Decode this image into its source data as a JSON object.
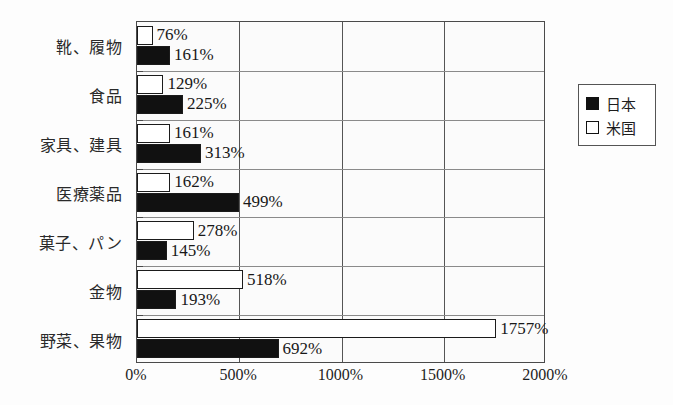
{
  "chart_data": {
    "type": "bar",
    "orientation": "horizontal",
    "title": "",
    "xlabel": "",
    "ylabel": "",
    "xlim": [
      0,
      2000
    ],
    "xticks": [
      "0%",
      "500%",
      "1000%",
      "1500%",
      "2000%"
    ],
    "xtick_values": [
      0,
      500,
      1000,
      1500,
      2000
    ],
    "grid": true,
    "legend_position": "right",
    "categories": [
      "靴、履物",
      "食品",
      "家具、建具",
      "医療薬品",
      "菓子、パン",
      "金物",
      "野菜、果物"
    ],
    "series": [
      {
        "name": "米国",
        "key": "us",
        "color": "#ffffff",
        "values": [
          76,
          129,
          161,
          162,
          278,
          518,
          1757
        ],
        "labels": [
          "76%",
          "129%",
          "161%",
          "162%",
          "278%",
          "518%",
          "1757%"
        ]
      },
      {
        "name": "日本",
        "key": "jp",
        "color": "#111111",
        "values": [
          161,
          225,
          313,
          499,
          145,
          193,
          692
        ],
        "labels": [
          "161%",
          "225%",
          "313%",
          "499%",
          "145%",
          "193%",
          "692%"
        ]
      }
    ]
  },
  "legend": {
    "items": [
      {
        "label": "日本",
        "swatch": "jp"
      },
      {
        "label": "米国",
        "swatch": "us"
      }
    ]
  }
}
